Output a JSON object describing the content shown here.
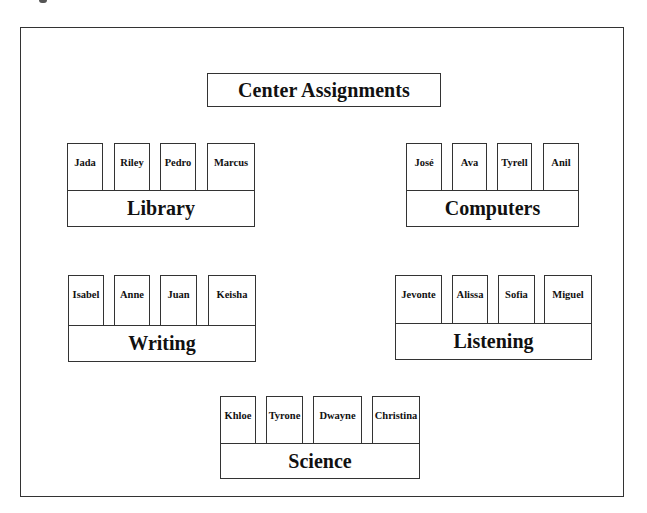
{
  "title": "Center Assignments",
  "centers": [
    {
      "id": "library",
      "label": "Library",
      "students": [
        "Jada",
        "Riley",
        "Pedro",
        "Marcus"
      ]
    },
    {
      "id": "computers",
      "label": "Computers",
      "students": [
        "José",
        "Ava",
        "Tyrell",
        "Anil"
      ]
    },
    {
      "id": "writing",
      "label": "Writing",
      "students": [
        "Isabel",
        "Anne",
        "Juan",
        "Keisha"
      ]
    },
    {
      "id": "listening",
      "label": "Listening",
      "students": [
        "Jevonte",
        "Alissa",
        "Sofia",
        "Miguel"
      ]
    },
    {
      "id": "science",
      "label": "Science",
      "students": [
        "Khloe",
        "Tyrone",
        "Dwayne",
        "Christina"
      ]
    }
  ],
  "colors": {
    "line": "#333333",
    "text": "#111111",
    "background": "#ffffff"
  }
}
